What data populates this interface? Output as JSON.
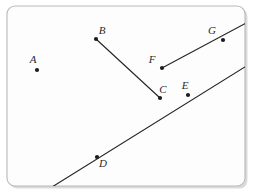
{
  "figure": {
    "background_color": "#ffffff",
    "panel_color": "#fdfdfd",
    "panel_border_color": "#b9b9b9",
    "ink_color": "#262626",
    "label_color": "#2b2b2b",
    "panel": {
      "x": 7,
      "y": 6,
      "width": 238,
      "height": 180,
      "radius": 8
    },
    "points": [
      {
        "id": "A",
        "label": "A",
        "x": 37,
        "y": 70,
        "label_x": 33,
        "label_y": 63,
        "on_line": "none"
      },
      {
        "id": "B",
        "label": "B",
        "x": 96,
        "y": 39,
        "label_x": 102,
        "label_y": 34,
        "on_line": "segment-bc"
      },
      {
        "id": "C",
        "label": "C",
        "x": 160,
        "y": 98,
        "label_x": 163,
        "label_y": 93,
        "on_line": "segment-bc"
      },
      {
        "id": "D",
        "label": "D",
        "x": 97,
        "y": 157,
        "label_x": 103,
        "label_y": 167,
        "on_line": "ray-de"
      },
      {
        "id": "E",
        "label": "E",
        "x": 188,
        "y": 95,
        "label_x": 185,
        "label_y": 89,
        "on_line": "ray-de"
      },
      {
        "id": "F",
        "label": "F",
        "x": 162,
        "y": 68,
        "label_x": 152,
        "label_y": 63,
        "on_line": "ray-fg"
      },
      {
        "id": "G",
        "label": "G",
        "x": 223,
        "y": 40,
        "label_x": 212,
        "label_y": 34,
        "on_line": "ray-fg"
      }
    ],
    "lines": [
      {
        "id": "segment-bc",
        "kind": "segment",
        "from": "B",
        "to": "C",
        "x1": 96,
        "y1": 39,
        "x2": 160,
        "y2": 98
      },
      {
        "id": "ray-fg",
        "kind": "ray",
        "from": "F",
        "through": "G",
        "x1": 162,
        "y1": 68,
        "x2": 248,
        "y2": 22
      },
      {
        "id": "ray-de",
        "kind": "line",
        "from": "D",
        "through": "E",
        "x1": 52,
        "y1": 187,
        "x2": 248,
        "y2": 65
      }
    ]
  }
}
